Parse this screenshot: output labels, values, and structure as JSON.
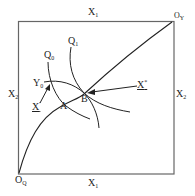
{
  "diagram": {
    "type": "edgeworth-box",
    "frame": {
      "x1": 18,
      "y1": 21,
      "x2": 174,
      "y2": 174,
      "color": "#555555"
    },
    "labels": {
      "top": {
        "base": "X",
        "sub": "1"
      },
      "bottom": {
        "base": "X",
        "sub": "1"
      },
      "left": {
        "base": "X",
        "sub": "2"
      },
      "right": {
        "base": "X",
        "sub": "2"
      },
      "origin_bottom_left": {
        "base": "O",
        "sub": "Q"
      },
      "origin_top_right": {
        "base": "O",
        "sub": "Y"
      },
      "curve_q0": {
        "base": "Q",
        "sub": "0"
      },
      "curve_q1": {
        "base": "Q",
        "sub": "1"
      },
      "curve_y0": {
        "base": "Y",
        "sub": "0"
      },
      "point_a": "A",
      "point_b": "B",
      "x_prime": {
        "base": "X",
        "sup": "'"
      },
      "x_star": {
        "base": "X",
        "sup": "*"
      }
    },
    "line_color": "#222222"
  }
}
